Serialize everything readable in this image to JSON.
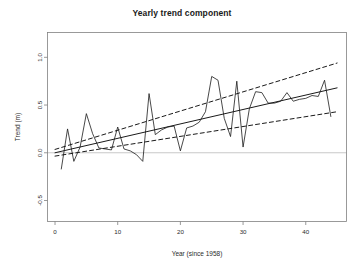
{
  "chart_data": {
    "type": "line",
    "title": "Yearly trend component",
    "xlabel": "Year (since 1958)",
    "ylabel": "Trend (m)",
    "xlim": [
      -1.2,
      46.5
    ],
    "ylim": [
      -0.72,
      1.26
    ],
    "xticks": [
      0,
      10,
      20,
      30,
      40
    ],
    "xtick_labels": [
      "0",
      "10",
      "20",
      "30",
      "40"
    ],
    "yticks": [
      -0.5,
      0.0,
      0.5,
      1.0
    ],
    "ytick_labels": [
      "-0.5",
      "0.0",
      "0.5",
      "1.0"
    ],
    "grid": false,
    "legend": null,
    "reference_lines": [
      {
        "name": "zero-line",
        "orientation": "horizontal",
        "y": 0.0,
        "color": "#c8c8c8",
        "style": "solid"
      }
    ],
    "series": [
      {
        "name": "yearly trend component",
        "style": "solid",
        "color": "#1a1a1a",
        "width": 0.8,
        "x": [
          1,
          2,
          3,
          4,
          5,
          6,
          7,
          8,
          9,
          10,
          11,
          12,
          13,
          14,
          15,
          16,
          17,
          18,
          19,
          20,
          21,
          22,
          23,
          24,
          25,
          26,
          27,
          28,
          29,
          30,
          31,
          32,
          33,
          34,
          35,
          36,
          37,
          38,
          39,
          40,
          41,
          42,
          43,
          44
        ],
        "values": [
          -0.17,
          0.25,
          -0.09,
          0.06,
          0.41,
          0.2,
          0.05,
          0.04,
          0.03,
          0.27,
          0.04,
          0.02,
          -0.02,
          -0.09,
          0.62,
          0.19,
          0.24,
          0.27,
          0.28,
          0.02,
          0.26,
          0.28,
          0.32,
          0.43,
          0.8,
          0.76,
          0.36,
          0.17,
          0.75,
          0.06,
          0.46,
          0.64,
          0.63,
          0.52,
          0.52,
          0.54,
          0.63,
          0.54,
          0.56,
          0.57,
          0.6,
          0.59,
          0.76,
          0.38
        ]
      },
      {
        "name": "fitted trend line",
        "style": "solid",
        "color": "#1a1a1a",
        "width": 1.0,
        "x": [
          0,
          45
        ],
        "values": [
          0.0,
          0.68
        ]
      },
      {
        "name": "upper confidence band",
        "style": "dashed",
        "color": "#1a1a1a",
        "width": 1.0,
        "x": [
          0,
          45
        ],
        "values": [
          0.035,
          0.94
        ]
      },
      {
        "name": "lower confidence band",
        "style": "dashed",
        "color": "#1a1a1a",
        "width": 1.0,
        "x": [
          0,
          45
        ],
        "values": [
          -0.035,
          0.43
        ]
      }
    ]
  }
}
